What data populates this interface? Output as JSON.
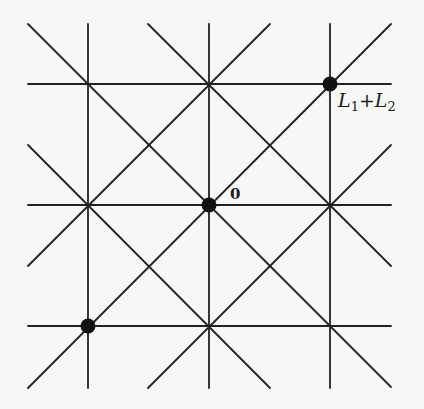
{
  "diagram": {
    "type": "lattice",
    "stroke_color": "#222222",
    "background": "#f7f7f5",
    "grid": {
      "vertical_x": [
        88,
        209,
        330
      ],
      "horizontal_y": [
        84,
        205,
        326
      ],
      "y_range": [
        24,
        388
      ],
      "x_range": [
        28,
        391
      ]
    },
    "diagonals": [
      {
        "x1": 28,
        "y1": 24,
        "x2": 391,
        "y2": 387
      },
      {
        "x1": 148,
        "y1": 24,
        "x2": 391,
        "y2": 266
      },
      {
        "x1": 28,
        "y1": 145,
        "x2": 270,
        "y2": 388
      },
      {
        "x1": 28,
        "y1": 388,
        "x2": 391,
        "y2": 24
      },
      {
        "x1": 148,
        "y1": 388,
        "x2": 391,
        "y2": 145
      },
      {
        "x1": 28,
        "y1": 266,
        "x2": 270,
        "y2": 24
      }
    ],
    "points": [
      {
        "name": "origin",
        "cx": 209,
        "cy": 205
      },
      {
        "name": "L1-plus-L2",
        "cx": 330,
        "cy": 84
      },
      {
        "name": "minus-L1-minus-L2",
        "cx": 88,
        "cy": 326
      }
    ],
    "labels": {
      "origin": "0",
      "sum_L": "L",
      "sum_sub1": "1",
      "sum_plus": "+",
      "sum_L2": "L",
      "sum_sub2": "2"
    }
  }
}
